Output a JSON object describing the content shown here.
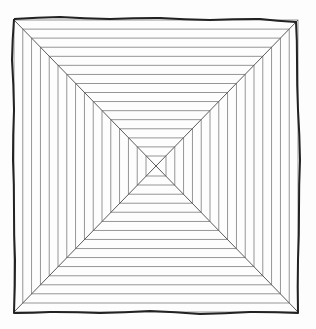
{
  "figure": {
    "title": "Concentric squares with diagonals",
    "colors": {
      "background": "#fdfdfd",
      "outer_border": "#222222",
      "inner_lines": "#8a8a8a",
      "diagonals": "#5a5a5a"
    },
    "geometry": {
      "center": [
        156,
        166
      ],
      "outer_half_width": 142,
      "outer_half_height": 146,
      "inner_half_size": 10,
      "ring_count": 16
    },
    "outer_border_points": [
      [
        14,
        19
      ],
      [
        60,
        17
      ],
      [
        110,
        19
      ],
      [
        160,
        18
      ],
      [
        210,
        20
      ],
      [
        260,
        19
      ],
      [
        296,
        22
      ],
      [
        297,
        60
      ],
      [
        298,
        110
      ],
      [
        300,
        160
      ],
      [
        299,
        210
      ],
      [
        298,
        260
      ],
      [
        298,
        313
      ],
      [
        250,
        312
      ],
      [
        200,
        314
      ],
      [
        150,
        311
      ],
      [
        100,
        313
      ],
      [
        50,
        312
      ],
      [
        14,
        313
      ],
      [
        15,
        260
      ],
      [
        14,
        210
      ],
      [
        13,
        160
      ],
      [
        14,
        110
      ],
      [
        12,
        60
      ],
      [
        14,
        19
      ]
    ]
  }
}
